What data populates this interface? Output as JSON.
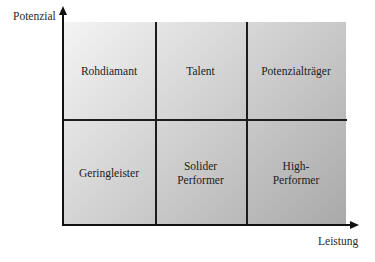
{
  "diagram": {
    "type": "portfolio-matrix-2x3",
    "axes": {
      "y_label": "Potenzial",
      "x_label": "Leistung"
    },
    "cells": {
      "top_left": "Rohdiamant",
      "top_middle": "Talent",
      "top_right": "Potenzialträger",
      "bottom_left": "Geringleister",
      "bottom_middle_line1": "Solider",
      "bottom_middle_line2": "Performer",
      "bottom_right_line1": "High-",
      "bottom_right_line2": "Performer"
    },
    "colors": {
      "gradient_light": "#f4f4f4",
      "gradient_mid": "#d6d6d6",
      "gradient_dark": "#a9a9a9",
      "lines": "#1c1c1c"
    }
  }
}
